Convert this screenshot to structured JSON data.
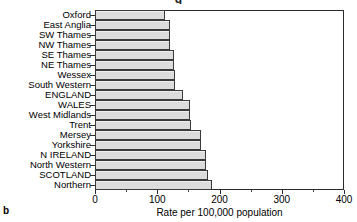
{
  "figure": {
    "panel_letter": "b",
    "title_fragment": "g",
    "axis_title": "Rate per 100,000 population"
  },
  "chart_data": {
    "type": "bar",
    "orientation": "horizontal",
    "title": "",
    "xlabel": "Rate per 100,000 population",
    "ylabel": "",
    "xlim": [
      0,
      400
    ],
    "xticks": [
      0,
      100,
      200,
      300,
      400
    ],
    "xtick_labels": [
      "0",
      "100",
      "200",
      "300",
      "400"
    ],
    "grid": false,
    "legend": null,
    "bar_fill_color": "#dcdcdc",
    "bar_edge_color": "#3a3a3a",
    "categories": [
      "Oxford",
      "East Anglia",
      "SW Thames",
      "NW Thames",
      "SE Thames",
      "NE Thames",
      "Wessex",
      "South Western",
      "ENGLAND",
      "WALES",
      "West Midlands",
      "Trent",
      "Mersey",
      "Yorkshire",
      "N IRELAND",
      "North Western",
      "SCOTLAND",
      "Northern"
    ],
    "values": [
      112,
      121,
      121,
      121,
      127,
      127,
      128,
      128,
      141,
      152,
      152,
      155,
      170,
      171,
      178,
      178,
      181,
      188
    ]
  }
}
